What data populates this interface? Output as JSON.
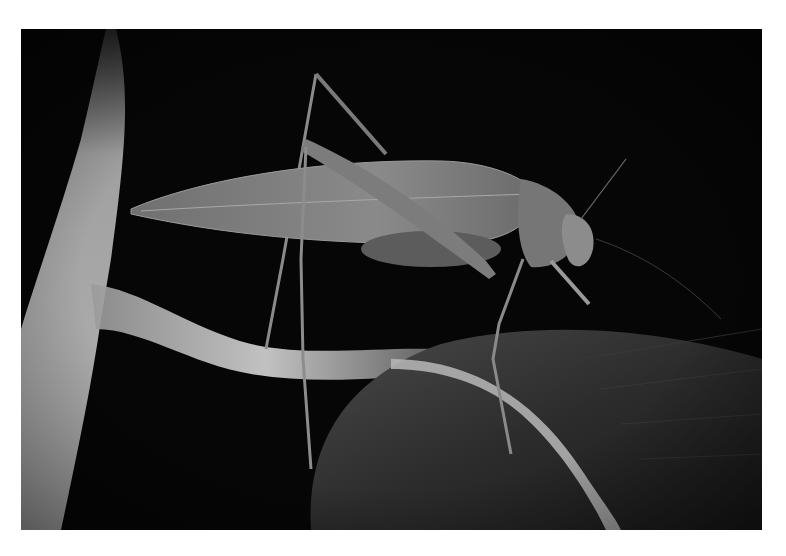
{
  "image": {
    "subject": "Katydid perched on a leaf stem at night",
    "style": "grayscale macro photograph",
    "background_color": "#060606",
    "frame_color": "#ffffff"
  }
}
